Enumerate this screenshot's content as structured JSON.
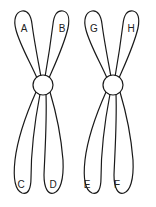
{
  "diagram": {
    "title": "",
    "chromosomes": [
      {
        "id": "left",
        "upper_arms": [
          "A",
          "B"
        ],
        "lower_arms": [
          "C",
          "D"
        ]
      },
      {
        "id": "right",
        "upper_arms": [
          "G",
          "H"
        ],
        "lower_arms": [
          "E",
          "F"
        ]
      }
    ],
    "labels": {
      "A": "A",
      "B": "B",
      "C": "C",
      "D": "D",
      "E": "E",
      "F": "F",
      "G": "G",
      "H": "H"
    },
    "colors": {
      "stroke": "#1a1a1a",
      "fill": "#ffffff"
    }
  }
}
